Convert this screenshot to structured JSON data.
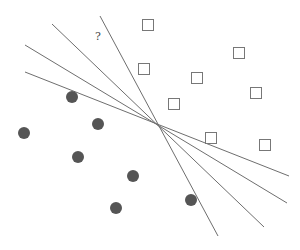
{
  "diagram": {
    "title": "",
    "colors": {
      "line": "#6e6e6e",
      "circle_fill": "#555555",
      "square_stroke": "#777777",
      "background": "#ffffff"
    },
    "query_label": {
      "text": "?",
      "x": 95,
      "y": 30
    },
    "lines": [
      {
        "x1": 100,
        "y1": 16,
        "x2": 218,
        "y2": 236
      },
      {
        "x1": 52,
        "y1": 24,
        "x2": 264,
        "y2": 227
      },
      {
        "x1": 25,
        "y1": 45,
        "x2": 287,
        "y2": 203
      },
      {
        "x1": 25,
        "y1": 72,
        "x2": 289,
        "y2": 176
      }
    ],
    "squares": [
      {
        "x": 148,
        "y": 25
      },
      {
        "x": 239,
        "y": 53
      },
      {
        "x": 144,
        "y": 69
      },
      {
        "x": 197,
        "y": 78
      },
      {
        "x": 256,
        "y": 93
      },
      {
        "x": 174,
        "y": 104
      },
      {
        "x": 211,
        "y": 138
      },
      {
        "x": 265,
        "y": 145
      }
    ],
    "circles": [
      {
        "x": 72,
        "y": 97
      },
      {
        "x": 98,
        "y": 124
      },
      {
        "x": 24,
        "y": 133
      },
      {
        "x": 78,
        "y": 157
      },
      {
        "x": 133,
        "y": 176
      },
      {
        "x": 191,
        "y": 200
      },
      {
        "x": 116,
        "y": 208
      }
    ]
  }
}
